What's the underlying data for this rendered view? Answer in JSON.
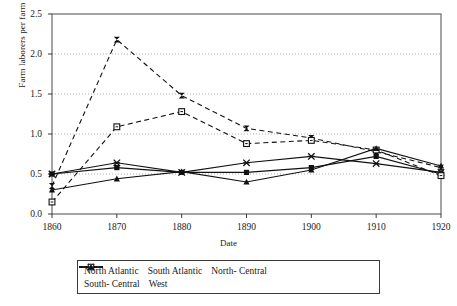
{
  "chart_data": {
    "type": "line",
    "title": "",
    "xlabel": "Date",
    "ylabel": "Farm laborers per farm",
    "x": [
      1860,
      1870,
      1880,
      1890,
      1900,
      1910,
      1920
    ],
    "xlim": [
      1860,
      1920
    ],
    "ylim": [
      0.0,
      2.5
    ],
    "yticks": [
      "0.0",
      "0.5",
      "1.0",
      "1.5",
      "2.0",
      "2.5"
    ],
    "xticks": [
      "1860",
      "1870",
      "1880",
      "1890",
      "1900",
      "1910",
      "1920"
    ],
    "grid": "horizontal-dotted",
    "legend_position": "bottom",
    "series": [
      {
        "name": "North Atlantic",
        "marker": "filled-square",
        "line": "solid",
        "values": [
          0.5,
          0.58,
          0.52,
          0.52,
          0.58,
          0.72,
          0.5
        ]
      },
      {
        "name": "South Atlantic",
        "marker": "bowtie",
        "line": "dashed",
        "values": [
          0.35,
          2.18,
          1.48,
          1.07,
          0.95,
          0.78,
          0.58
        ]
      },
      {
        "name": "North- Central",
        "marker": "star-cross",
        "line": "solid",
        "values": [
          0.5,
          0.64,
          0.52,
          0.64,
          0.72,
          0.63,
          0.52
        ]
      },
      {
        "name": "South- Central",
        "marker": "open-square",
        "line": "dashed",
        "values": [
          0.15,
          1.09,
          1.28,
          0.88,
          0.92,
          0.8,
          0.48
        ]
      },
      {
        "name": "West",
        "marker": "filled-triangle",
        "line": "solid",
        "values": [
          0.3,
          0.44,
          0.53,
          0.4,
          0.55,
          0.82,
          0.6
        ]
      }
    ]
  }
}
